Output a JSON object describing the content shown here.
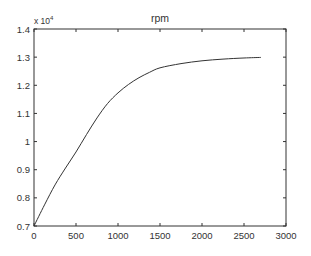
{
  "chart_data": {
    "type": "line",
    "title": "rpm",
    "xlabel": "",
    "ylabel": "",
    "y_scale_label": "x 10",
    "y_scale_exponent": "4",
    "xlim": [
      0,
      3000
    ],
    "ylim": [
      0.7,
      1.4
    ],
    "x_ticks": [
      0,
      500,
      1000,
      1500,
      2000,
      2500,
      3000
    ],
    "x_tick_labels": [
      "0",
      "500",
      "1000",
      "1500",
      "2000",
      "2500",
      "3000"
    ],
    "y_ticks": [
      0.7,
      0.8,
      0.9,
      1.0,
      1.1,
      1.2,
      1.3,
      1.4
    ],
    "y_tick_labels": [
      "0.7",
      "0.8",
      "0.9",
      "1",
      "1.1",
      "1.2",
      "1.3",
      "1.4"
    ],
    "grid": false,
    "legend": null,
    "series": [
      {
        "name": "rpm",
        "color": "#333333",
        "x": [
          0,
          125,
          250,
          375,
          500,
          625,
          750,
          875,
          1000,
          1125,
          1250,
          1375,
          1500,
          1750,
          2000,
          2250,
          2500,
          2700
        ],
        "y": [
          0.7,
          0.775,
          0.846,
          0.906,
          0.963,
          1.025,
          1.084,
          1.135,
          1.173,
          1.203,
          1.227,
          1.246,
          1.262,
          1.277,
          1.287,
          1.293,
          1.297,
          1.299
        ]
      }
    ]
  },
  "colors": {
    "axis": "#333333",
    "line": "#333333",
    "background": "#ffffff"
  }
}
